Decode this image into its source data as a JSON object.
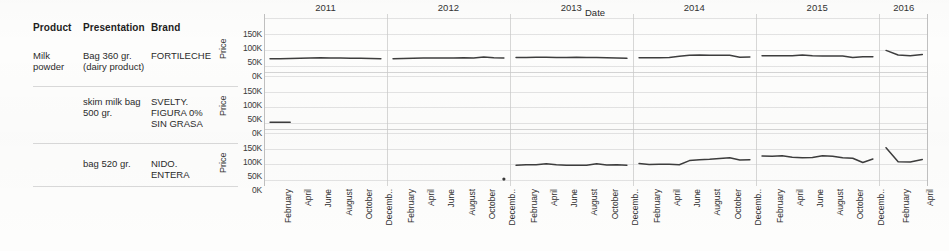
{
  "table": {
    "headers": {
      "product": "Product",
      "presentation": "Presentation",
      "brand": "Brand"
    },
    "rows": [
      {
        "product": "Milk powder",
        "presentation": "Bag 360 gr. (dairy product)",
        "brand": "FORTILECHE"
      },
      {
        "product": "",
        "presentation": "skim milk bag 500 gr.",
        "brand": "SVELTY. FIGURA 0% SIN GRASA"
      },
      {
        "product": "",
        "presentation": "bag 520 gr.",
        "brand": "NIDO. ENTERA"
      }
    ]
  },
  "axes": {
    "y_label": "Price",
    "y_ticks": [
      "150K",
      "100K",
      "50K",
      "0K"
    ],
    "x_title": "Date",
    "x_tick_labels": [
      "February",
      "April",
      "June",
      "August",
      "October",
      "Decemb.."
    ],
    "x_tick_labels_2016": [
      "February",
      "April"
    ]
  },
  "chart_data": {
    "type": "line",
    "title": "",
    "subtitle": "",
    "xlabel": "Date",
    "ylabel": "Price",
    "ylim": [
      0,
      160000
    ],
    "y_ticks": [
      0,
      50000,
      100000,
      150000
    ],
    "y_tick_labels": [
      "0K",
      "50K",
      "100K",
      "150K"
    ],
    "grid": true,
    "legend": "none",
    "facet_rows": [
      "FORTILECHE",
      "SVELTY. FIGURA 0% SIN GRASA",
      "NIDO. ENTERA"
    ],
    "facet_cols": [
      "2011",
      "2012",
      "2013",
      "2014",
      "2015",
      "2016"
    ],
    "x_months": [
      "January",
      "February",
      "March",
      "April",
      "May",
      "June",
      "July",
      "August",
      "September",
      "October",
      "November",
      "December"
    ],
    "series": [
      {
        "name": "FORTILECHE",
        "row": 0,
        "panels": [
          {
            "year": "2011",
            "months": [
              1,
              2,
              3,
              4,
              5,
              6,
              7,
              8,
              9,
              10,
              11,
              12
            ],
            "values": [
              24000,
              24500,
              25000,
              25500,
              26500,
              27500,
              27000,
              26500,
              26000,
              25500,
              25000,
              24500
            ]
          },
          {
            "year": "2012",
            "months": [
              1,
              2,
              3,
              4,
              5,
              6,
              7,
              8,
              9,
              10,
              11,
              12
            ],
            "values": [
              24000,
              25000,
              26000,
              26500,
              27000,
              27000,
              27000,
              27500,
              27000,
              30000,
              27500,
              26500
            ]
          },
          {
            "year": "2013",
            "months": [
              1,
              2,
              3,
              4,
              5,
              6,
              7,
              8,
              9,
              10,
              11,
              12
            ],
            "values": [
              28000,
              28500,
              29000,
              29500,
              28500,
              28500,
              29500,
              28500,
              28000,
              27500,
              27000,
              25500
            ]
          },
          {
            "year": "2014",
            "months": [
              1,
              2,
              3,
              4,
              5,
              6,
              7,
              8,
              9,
              10,
              11,
              12
            ],
            "values": [
              27500,
              27500,
              27500,
              28500,
              32500,
              36000,
              36500,
              35500,
              35500,
              35500,
              29500,
              30000
            ]
          },
          {
            "year": "2015",
            "months": [
              1,
              2,
              3,
              4,
              5,
              6,
              7,
              8,
              9,
              10,
              11,
              12
            ],
            "values": [
              34500,
              34500,
              34000,
              34000,
              36500,
              34000,
              33500,
              33500,
              33000,
              28500,
              30500,
              30500
            ]
          },
          {
            "year": "2016",
            "months": [
              1,
              2,
              3,
              4
            ],
            "values": [
              52000,
              36500,
              34500,
              38000
            ]
          }
        ]
      },
      {
        "name": "SVELTY. FIGURA 0% SIN GRASA",
        "row": 1,
        "panels": [
          {
            "year": "2011",
            "months": [
              1,
              2,
              3
            ],
            "values": [
              2500,
              2500,
              2500
            ]
          },
          {
            "year": "2012",
            "months": [],
            "values": []
          },
          {
            "year": "2013",
            "months": [],
            "values": []
          },
          {
            "year": "2014",
            "months": [],
            "values": []
          },
          {
            "year": "2015",
            "months": [],
            "values": []
          },
          {
            "year": "2016",
            "months": [],
            "values": []
          }
        ]
      },
      {
        "name": "NIDO. ENTERA",
        "row": 2,
        "panels": [
          {
            "year": "2011",
            "months": [],
            "values": []
          },
          {
            "year": "2012",
            "months": [
              12
            ],
            "values": [
              3000
            ]
          },
          {
            "year": "2013",
            "months": [
              1,
              2,
              3,
              4,
              5,
              6,
              7,
              8,
              9,
              10,
              11,
              12
            ],
            "values": [
              50000,
              51500,
              52000,
              55000,
              51500,
              50500,
              50000,
              50500,
              55000,
              51000,
              51500,
              50000
            ]
          },
          {
            "year": "2014",
            "months": [
              1,
              2,
              3,
              4,
              5,
              6,
              7,
              8,
              9,
              10,
              11,
              12
            ],
            "values": [
              56000,
              53000,
              53500,
              53500,
              52000,
              66000,
              69000,
              70500,
              73000,
              76000,
              68000,
              69000
            ]
          },
          {
            "year": "2015",
            "months": [
              1,
              2,
              3,
              4,
              5,
              6,
              7,
              8,
              9,
              10,
              11,
              12
            ],
            "values": [
              82000,
              80500,
              82500,
              77500,
              75500,
              76500,
              82500,
              81000,
              75500,
              74000,
              59500,
              71500
            ]
          },
          {
            "year": "2016",
            "months": [
              1,
              2,
              3,
              4
            ],
            "values": [
              110000,
              62500,
              61000,
              70000
            ]
          }
        ]
      }
    ]
  }
}
